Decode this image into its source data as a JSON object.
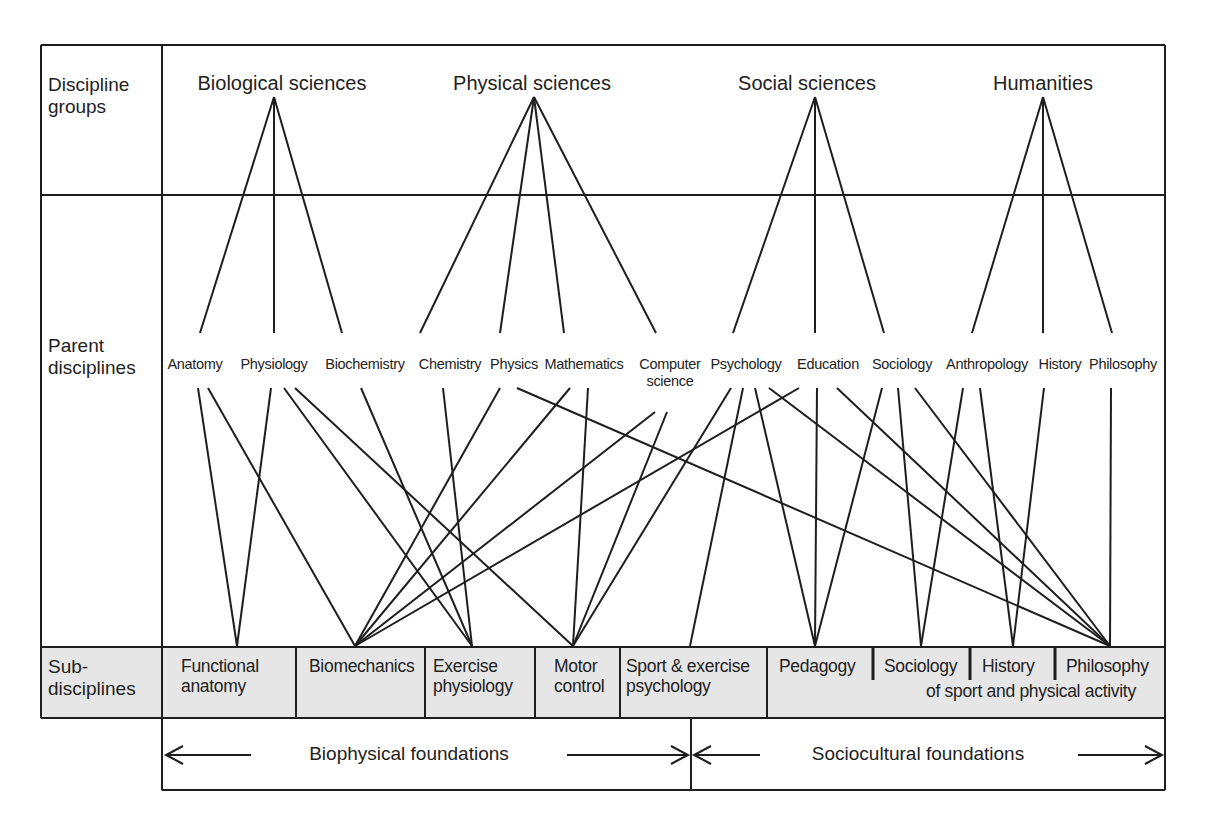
{
  "row_labels": {
    "discipline_groups": "Discipline groups",
    "parent_disciplines": "Parent disciplines",
    "sub_disciplines": "Sub- disciplines"
  },
  "groups": [
    {
      "label": "Biological sciences",
      "x": 282,
      "apex": 274
    },
    {
      "label": "Physical sciences",
      "x": 532,
      "apex": 534
    },
    {
      "label": "Social sciences",
      "x": 807,
      "apex": 815
    },
    {
      "label": "Humanities",
      "x": 1043,
      "apex": 1043
    }
  ],
  "parents": [
    {
      "label": "Anatomy",
      "x": 195,
      "group": 0
    },
    {
      "label": "Physiology",
      "x": 274,
      "group": 0
    },
    {
      "label": "Biochemistry",
      "x": 365,
      "group": 0
    },
    {
      "label": "Chemistry",
      "x": 450,
      "group": 1
    },
    {
      "label": "Physics",
      "x": 514,
      "group": 1
    },
    {
      "label": "Mathematics",
      "x": 584,
      "group": 1
    },
    {
      "label": "Computer science",
      "x": 670,
      "group": 1
    },
    {
      "label": "Psychology",
      "x": 746,
      "group": 2
    },
    {
      "label": "Education",
      "x": 828,
      "group": 2
    },
    {
      "label": "Sociology",
      "x": 902,
      "group": 2
    },
    {
      "label": "Anthropology",
      "x": 987,
      "group": 3
    },
    {
      "label": "History",
      "x": 1060,
      "group": 3
    },
    {
      "label": "Philosophy",
      "x": 1123,
      "group": 3
    }
  ],
  "sub_disciplines": [
    {
      "label": "Functional anatomy",
      "line1": "Functional",
      "line2": "anatomy",
      "node_x": 237
    },
    {
      "label": "Biomechanics",
      "line1": "Biomechanics",
      "line2": "",
      "node_x": 355
    },
    {
      "label": "Exercise physiology",
      "line1": "Exercise",
      "line2": "physiology",
      "node_x": 472
    },
    {
      "label": "Motor control",
      "line1": "Motor",
      "line2": "control",
      "node_x": 573
    },
    {
      "label": "Sport & exercise psychology",
      "line1": "Sport & exercise",
      "line2": "psychology",
      "node_x": 690
    },
    {
      "label": "Pedagogy",
      "line1": "Pedagogy",
      "line2": "",
      "node_x": 815
    },
    {
      "label": "Sociology",
      "line1": "Sociology",
      "line2": "",
      "node_x": 921
    },
    {
      "label": "History",
      "line1": "History",
      "line2": "",
      "node_x": 1013
    },
    {
      "label": "Philosophy",
      "line1": "Philosophy",
      "line2": "",
      "node_x": 1110
    }
  ],
  "sub_shared_suffix": "of sport and physical activity",
  "foundations": [
    {
      "label": "Biophysical foundations"
    },
    {
      "label": "Sociocultural foundations"
    }
  ],
  "connections": [
    {
      "from": "Anatomy",
      "x": 198,
      "to": "Functional anatomy"
    },
    {
      "from": "Anatomy",
      "x": 208,
      "to": "Biomechanics"
    },
    {
      "from": "Physiology",
      "x": 271,
      "to": "Functional anatomy"
    },
    {
      "from": "Physiology",
      "x": 284,
      "to": "Exercise physiology"
    },
    {
      "from": "Physiology",
      "x": 295,
      "to": "Motor control"
    },
    {
      "from": "Biochemistry",
      "x": 361,
      "to": "Exercise physiology"
    },
    {
      "from": "Chemistry",
      "x": 443,
      "to": "Exercise physiology"
    },
    {
      "from": "Physics",
      "x": 500,
      "to": "Biomechanics"
    },
    {
      "from": "Physics",
      "x": 517,
      "to": "Philosophy"
    },
    {
      "from": "Mathematics",
      "x": 570,
      "to": "Biomechanics"
    },
    {
      "from": "Mathematics",
      "x": 588,
      "to": "Motor control"
    },
    {
      "from": "Computer science",
      "x": 655,
      "y": 412,
      "to": "Biomechanics"
    },
    {
      "from": "Computer science",
      "x": 667,
      "y": 412,
      "to": "Motor control"
    },
    {
      "from": "Psychology",
      "x": 731,
      "to": "Motor control"
    },
    {
      "from": "Psychology",
      "x": 743,
      "to": "Sport & exercise psychology"
    },
    {
      "from": "Psychology",
      "x": 755,
      "to": "Pedagogy"
    },
    {
      "from": "Psychology",
      "x": 769,
      "to": "Philosophy"
    },
    {
      "from": "Education",
      "x": 799,
      "to": "Biomechanics"
    },
    {
      "from": "Education",
      "x": 817,
      "to": "Pedagogy"
    },
    {
      "from": "Education",
      "x": 837,
      "to": "Philosophy"
    },
    {
      "from": "Sociology",
      "x": 882,
      "to": "Pedagogy"
    },
    {
      "from": "Sociology",
      "x": 898,
      "to": "Sociology"
    },
    {
      "from": "Sociology",
      "x": 915,
      "to": "Philosophy"
    },
    {
      "from": "Anthropology",
      "x": 963,
      "to": "Sociology"
    },
    {
      "from": "Anthropology",
      "x": 980,
      "to": "History"
    },
    {
      "from": "History",
      "x": 1044,
      "to": "History"
    },
    {
      "from": "Philosophy",
      "x": 1111,
      "to": "Philosophy"
    }
  ],
  "colors": {
    "line": "#1e1e1e",
    "sub_fill": "#e6e6e6",
    "text": "#222222"
  }
}
